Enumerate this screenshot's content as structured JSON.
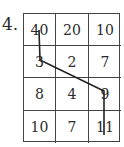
{
  "problem": {
    "number_label": "4.",
    "grid": {
      "rows": [
        [
          "40",
          "20",
          "10"
        ],
        [
          "3",
          "2",
          "7"
        ],
        [
          "8",
          "4",
          "9"
        ],
        [
          "10",
          "7",
          "11"
        ]
      ]
    },
    "path": {
      "description": "line from 40 down to 3, diagonally to 9, then down to 11",
      "cells": [
        "40",
        "3",
        "9",
        "11"
      ],
      "color": "#222222"
    }
  }
}
